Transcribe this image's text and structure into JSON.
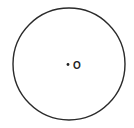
{
  "diagram": {
    "type": "circle-with-center",
    "circle": {
      "cx": 69,
      "cy": 64,
      "r": 56,
      "stroke": "#2a2a2a"
    },
    "center_point": {
      "x": 68,
      "y": 64,
      "label": "O"
    }
  }
}
